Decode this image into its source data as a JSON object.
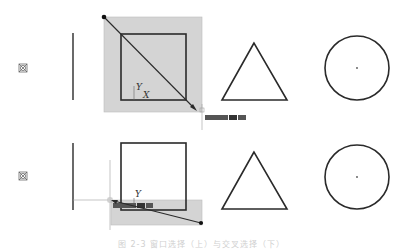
{
  "figure": {
    "caption": "图 2-3 窗口选择（上）与交叉选择（下）",
    "panels": [
      {
        "id": "window-selection",
        "description": "Selection drawn from upper-left to lower-right (window selection)",
        "selection_color": "#d0d0d0",
        "axis_labels": {
          "y": "Y",
          "x": "X"
        },
        "objects": [
          "point-marker",
          "vertical-line",
          "square",
          "triangle",
          "circle"
        ]
      },
      {
        "id": "crossing-selection",
        "description": "Selection drawn from lower-right to upper-left (crossing selection)",
        "selection_color": "#d0d0d0",
        "axis_labels": {
          "y": "Y"
        },
        "objects": [
          "point-marker",
          "vertical-line",
          "square",
          "triangle",
          "circle"
        ]
      }
    ],
    "colors": {
      "stroke": "#2a2a2a",
      "selection_fill": "#d4d4d4",
      "crosshair": "#9a9a9a",
      "input_box": "#444444"
    }
  }
}
